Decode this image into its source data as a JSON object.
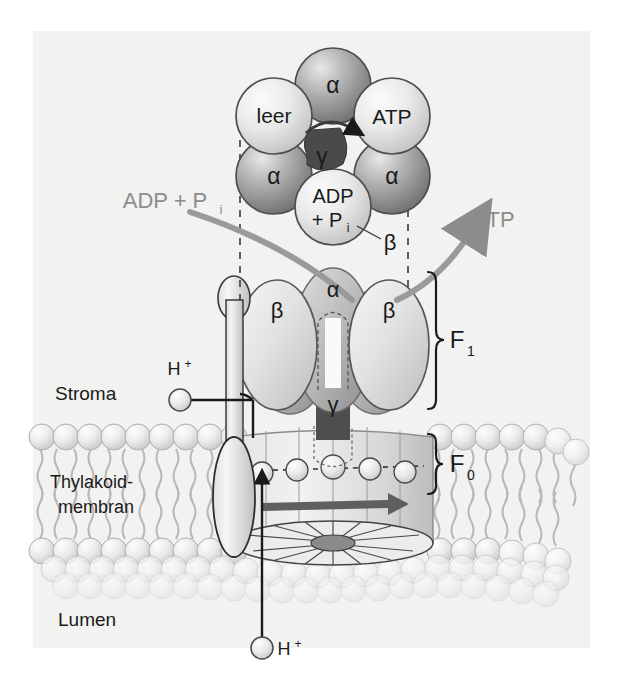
{
  "figure": {
    "background_color": "#f2f2f1",
    "page_color": "#ffffff",
    "accent_gray": "#8c8c8c",
    "ink": "#1a1a1a",
    "dark_fill": "#555555"
  },
  "compartments": {
    "top_label": "Stroma",
    "membrane_label_line1": "Thylakoid-",
    "membrane_label_line2": "membran",
    "bottom_label": "Lumen"
  },
  "head_ring": {
    "note": "hexameric alpha3beta3 head viewed from above",
    "subunits": [
      {
        "label": "α",
        "role": "alpha",
        "shade": "dark",
        "cx": 333,
        "cy": 86,
        "r": 37
      },
      {
        "label": "ATP",
        "role": "beta",
        "shade": "light",
        "cx": 391,
        "cy": 115,
        "r": 37
      },
      {
        "label": "α",
        "role": "alpha",
        "shade": "dark",
        "cx": 391,
        "cy": 176,
        "r": 37
      },
      {
        "label": "ADP\n+ P",
        "role": "beta",
        "shade": "light",
        "cx": 333,
        "cy": 207,
        "r": 37
      },
      {
        "label": "α",
        "role": "alpha",
        "shade": "dark",
        "cx": 275,
        "cy": 176,
        "r": 37
      },
      {
        "label": "leer",
        "role": "beta",
        "shade": "light",
        "cx": 275,
        "cy": 115,
        "r": 37
      }
    ],
    "adp_label_line1": "ADP",
    "adp_label_line2": "+ P",
    "adp_label_sub": "i",
    "atp_label": "ATP",
    "empty_label": "leer",
    "alpha_label": "α",
    "beta_callout_label": "β",
    "gamma_label": "γ",
    "rotation_direction": "clockwise"
  },
  "f1_complex": {
    "bracket_label": "F",
    "bracket_sub": "1",
    "alpha_label": "α",
    "beta_left_label": "β",
    "beta_right_label": "β",
    "gamma_label": "γ"
  },
  "f0_complex": {
    "bracket_label": "F",
    "bracket_sub": "0",
    "rotor_arrow_direction": "right"
  },
  "reactants": {
    "substrate_label": "ADP + P",
    "substrate_sub": "i",
    "product_label": "ATP"
  },
  "protons": {
    "stroma_label": "H",
    "stroma_sup": "+",
    "lumen_label": "H",
    "lumen_sup": "+",
    "channel_protons_count": 5
  }
}
